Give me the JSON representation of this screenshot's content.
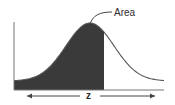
{
  "diagram": {
    "area_label": "Area",
    "z_label": "z",
    "shaded_fraction_of_x_range": 0.6,
    "colors": {
      "shade": "#3a3a3a",
      "curve": "#555555",
      "axis": "#777777",
      "text": "#2a2a2a"
    }
  }
}
